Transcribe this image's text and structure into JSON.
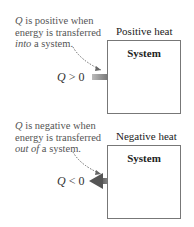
{
  "panels": [
    {
      "note": {
        "q": "Q",
        "line1_rest": " is positive when",
        "line2": "energy is transferred",
        "emph": "into",
        "line3_rest": " a system."
      },
      "heat_label": "Positive heat",
      "box_title": "System",
      "condition": {
        "q": "Q",
        "op": " > 0"
      },
      "arrow_direction": "into-system"
    },
    {
      "note": {
        "q": "Q",
        "line1_rest": " is negative when",
        "line2": "energy is transferred",
        "emph": "out of",
        "line3_rest": " a system."
      },
      "heat_label": "Negative heat",
      "box_title": "System",
      "condition": {
        "q": "Q",
        "op": " < 0"
      },
      "arrow_direction": "out-of-system"
    }
  ],
  "colors": {
    "arrow": "#555555",
    "box_border": "#777777",
    "note_text": "#555555"
  }
}
